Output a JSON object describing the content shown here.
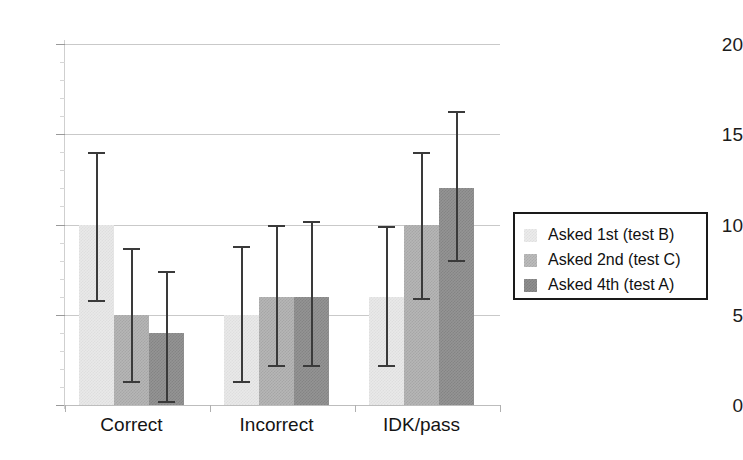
{
  "chart_data": {
    "type": "bar",
    "title": "",
    "subtitle": "",
    "xlabel": "",
    "ylabel": "",
    "categories": [
      "Correct",
      "Incorrect",
      "IDK/pass"
    ],
    "series": [
      {
        "name": "Asked 1st (test B)",
        "swatch": "s0",
        "color": "#e9e9e9",
        "values": [
          10,
          5,
          6
        ],
        "error_low": [
          5.7,
          1.2,
          2.1
        ],
        "error_high": [
          14.0,
          8.8,
          9.9
        ]
      },
      {
        "name": "Asked 2nd (test C)",
        "swatch": "s1",
        "color": "#b6b6b6",
        "values": [
          5,
          6,
          10
        ],
        "error_low": [
          1.2,
          2.1,
          5.8
        ],
        "error_high": [
          8.7,
          10.0,
          14.0
        ]
      },
      {
        "name": "Asked 4th (test A)",
        "swatch": "s2",
        "color": "#949494",
        "values": [
          4,
          6,
          12
        ],
        "error_low": [
          0.1,
          2.1,
          7.9
        ],
        "error_high": [
          7.4,
          10.2,
          16.3
        ]
      }
    ],
    "ylim": [
      0,
      20
    ],
    "yticks": [
      0,
      5,
      10,
      15,
      20
    ],
    "ytick_labels": [
      "0",
      "5",
      "10",
      "15",
      "20"
    ],
    "grid": true,
    "grid_axis": "y",
    "error_bars": true,
    "legend": {
      "position": "right",
      "bordered": true,
      "entries": [
        "Asked 1st (test B)",
        "Asked 2nd (test C)",
        "Asked 4th (test A)"
      ]
    }
  }
}
